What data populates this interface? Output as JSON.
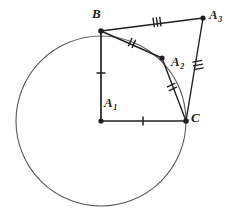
{
  "figure": {
    "kind": "geometry-diagram",
    "width": 230,
    "height": 214,
    "background_color": "#ffffff",
    "stroke_color": "#231f20",
    "circle_stroke_color": "#58595b"
  },
  "points": [
    {
      "id": "A1",
      "label": "A",
      "subscript": "1",
      "x": 101,
      "y": 121,
      "label_x": 104,
      "label_y": 96,
      "on_circle": false,
      "role": "center"
    },
    {
      "id": "B",
      "label": "B",
      "subscript": "",
      "x": 101,
      "y": 31,
      "label_x": 92,
      "label_y": 7,
      "on_circle": true,
      "role": "vertex"
    },
    {
      "id": "A2",
      "label": "A",
      "subscript": "2",
      "x": 162,
      "y": 58,
      "label_x": 171,
      "label_y": 55,
      "on_circle": true,
      "role": "vertex"
    },
    {
      "id": "A3",
      "label": "A",
      "subscript": "3",
      "x": 203,
      "y": 18,
      "label_x": 209,
      "label_y": 8,
      "on_circle": false,
      "role": "vertex"
    },
    {
      "id": "C",
      "label": "C",
      "subscript": "",
      "x": 186,
      "y": 121,
      "label_x": 191,
      "label_y": 111,
      "on_circle": true,
      "role": "vertex"
    }
  ],
  "circle": {
    "center_x": 101,
    "center_y": 121,
    "radius": 85,
    "stroke_width": 1.1
  },
  "segments": [
    {
      "id": "B-A1",
      "from": "B",
      "to": "A1",
      "ticks": 1,
      "stroke_width": 1.6
    },
    {
      "id": "A1-C",
      "from": "A1",
      "to": "C",
      "ticks": 1,
      "stroke_width": 1.6
    },
    {
      "id": "B-A2",
      "from": "B",
      "to": "A2",
      "ticks": 2,
      "stroke_width": 1.4
    },
    {
      "id": "A2-C",
      "from": "A2",
      "to": "C",
      "ticks": 2,
      "stroke_width": 1.4
    },
    {
      "id": "B-A3",
      "from": "B",
      "to": "A3",
      "ticks": 3,
      "stroke_width": 1.4
    },
    {
      "id": "A3-C",
      "from": "A3",
      "to": "C",
      "ticks": 3,
      "stroke_width": 1.4
    }
  ],
  "tick_marks": [
    {
      "segment": "B-A1",
      "count": 1,
      "x": 101,
      "y": 73,
      "angle": 90
    },
    {
      "segment": "A1-C",
      "count": 1,
      "x": 143,
      "y": 121,
      "angle": 0
    },
    {
      "segment": "B-A2",
      "count": 2,
      "x": 132,
      "y": 43,
      "angle": 24
    },
    {
      "segment": "A2-C",
      "count": 2,
      "x": 172,
      "y": 87,
      "angle": 64
    },
    {
      "segment": "B-A3",
      "count": 3,
      "x": 157,
      "y": 22,
      "angle": -8
    },
    {
      "segment": "A3-C",
      "count": 3,
      "x": 198,
      "y": 65,
      "angle": 80
    }
  ],
  "point_dot_radius": 2.6
}
